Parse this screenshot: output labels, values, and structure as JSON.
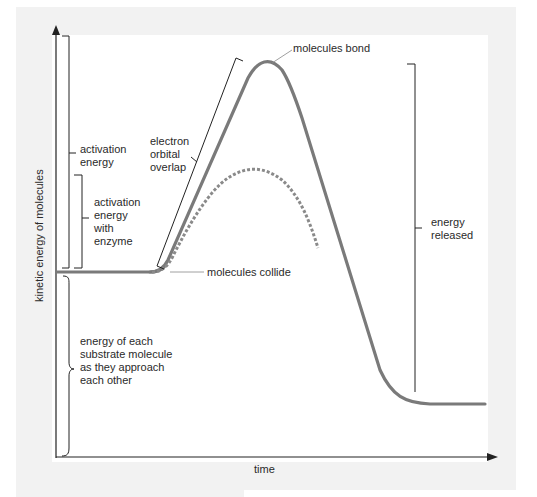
{
  "diagram": {
    "title": "",
    "axes": {
      "y_label": "kinetic energy of molecules",
      "x_label": "time"
    },
    "annotations": {
      "molecules_bond": "molecules bond",
      "molecules_collide": "molecules collide",
      "electron_orbital_overlap": [
        "electron",
        "orbital",
        "overlap"
      ],
      "activation_energy": [
        "activation",
        "energy"
      ],
      "activation_energy_enzyme": [
        "activation",
        "energy",
        "with",
        "enzyme"
      ],
      "energy_released": [
        "energy",
        "released"
      ],
      "substrate_energy": [
        "energy of each",
        "substrate molecule",
        "as they approach",
        "each other"
      ]
    },
    "curves": [
      {
        "name": "uncatalyzed reaction",
        "style": "solid",
        "color": "#7a7a7a"
      },
      {
        "name": "enzyme-catalyzed reaction",
        "style": "dashed",
        "color": "#8a8a8a"
      }
    ],
    "colors": {
      "background_panel": "#f1f1f1",
      "plot_area": "#ffffff",
      "curve": "#7a7a7a",
      "axis": "#222222"
    }
  }
}
